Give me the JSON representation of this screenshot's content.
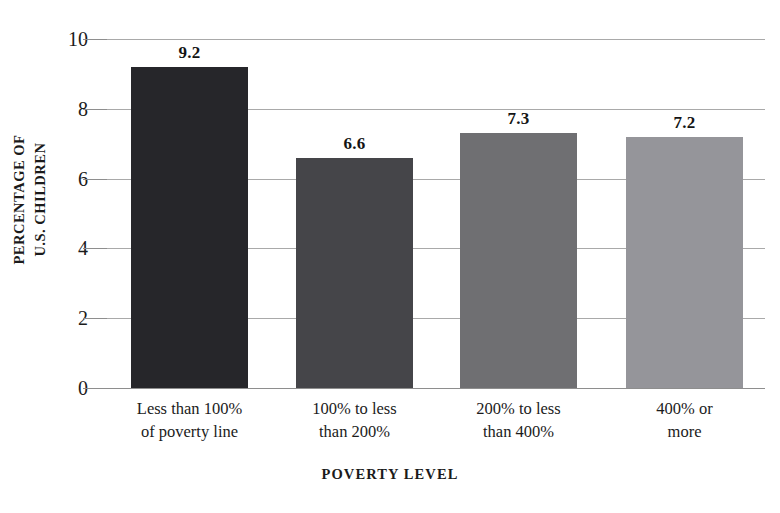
{
  "chart_data": {
    "type": "bar",
    "title": "",
    "xlabel": "POVERTY LEVEL",
    "ylabel_lines": [
      "PERCENTAGE OF",
      "U.S. CHILDREN"
    ],
    "ylabel": "PERCENTAGE OF U.S. CHILDREN",
    "categories": [
      "Less than 100% of poverty line",
      "100% to less than 200%",
      "200% to less than 400%",
      "400% or more"
    ],
    "category_lines": [
      [
        "Less than 100%",
        "of poverty line"
      ],
      [
        "100% to less",
        "than 200%"
      ],
      [
        "200% to less",
        "than 400%"
      ],
      [
        "400% or",
        "more"
      ]
    ],
    "values": [
      9.2,
      6.6,
      7.3,
      7.2
    ],
    "value_labels": [
      "9.2",
      "6.6",
      "7.3",
      "7.2"
    ],
    "bar_colors": [
      "#26262a",
      "#454549",
      "#6f6f72",
      "#95959a"
    ],
    "ylim": [
      0,
      10
    ],
    "yticks": [
      10,
      8,
      6,
      4,
      2,
      0
    ],
    "ytick_labels": [
      "10",
      "8",
      "6",
      "4",
      "2",
      "0"
    ],
    "grid": true,
    "grid_color": "#a9a9a9",
    "legend": "none",
    "background": "#ffffff"
  }
}
